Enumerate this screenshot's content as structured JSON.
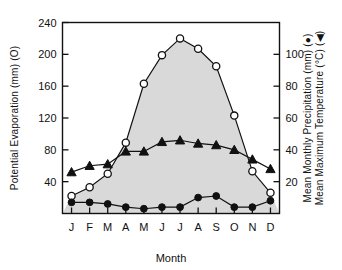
{
  "chart_data": {
    "type": "line",
    "title": "",
    "xlabel": "Month",
    "categories": [
      "J",
      "F",
      "M",
      "A",
      "M",
      "J",
      "J",
      "A",
      "S",
      "O",
      "N",
      "D"
    ],
    "grid": false,
    "legend_position": "in-axis-titles",
    "axes": {
      "left": {
        "label": "Potential Evaporation (mm) (O)",
        "ticks": [
          40,
          80,
          120,
          160,
          200,
          240
        ],
        "ylim": [
          0,
          240
        ],
        "marker": "open-circle"
      },
      "right": {
        "label_line1": "Mean Monthly Precipitation (mm) (●)",
        "label_line2": "Mean Maximum Temperature (°C) (◀)",
        "ticks": [
          20,
          40,
          60,
          80,
          100
        ],
        "ylim": [
          0,
          120
        ],
        "markers": [
          "filled-circle",
          "filled-triangle"
        ]
      }
    },
    "series": [
      {
        "name": "Potential Evaporation (mm)",
        "marker": "open-circle",
        "axis": "left",
        "fill": "shaded",
        "values": [
          22,
          33,
          50,
          89,
          163,
          199,
          220,
          207,
          185,
          123,
          53,
          26
        ]
      },
      {
        "name": "Mean Maximum Temperature (°C)",
        "marker": "filled-triangle",
        "axis": "right",
        "values": [
          26,
          30,
          31,
          39,
          39,
          45,
          46,
          44,
          43,
          40,
          34,
          28
        ]
      },
      {
        "name": "Mean Monthly Precipitation (mm)",
        "marker": "filled-circle",
        "axis": "right",
        "values": [
          7,
          7,
          6,
          4,
          3,
          4,
          4,
          10,
          11,
          4,
          4,
          8
        ]
      }
    ]
  }
}
